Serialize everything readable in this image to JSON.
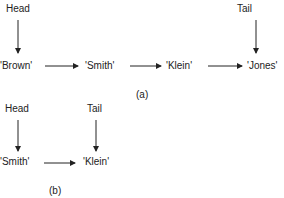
{
  "diagram_a": {
    "head_label": "Head",
    "tail_label": "Tail",
    "nodes": [
      "'Brown'",
      "'Smith'",
      "'Klein'",
      "'Jones'"
    ],
    "caption": "(a)"
  },
  "diagram_b": {
    "head_label": "Head",
    "tail_label": "Tail",
    "nodes": [
      "'Smith'",
      "'Klein'"
    ],
    "caption": "(b)"
  },
  "colors": {
    "ink": "#222222",
    "background": "#ffffff"
  }
}
